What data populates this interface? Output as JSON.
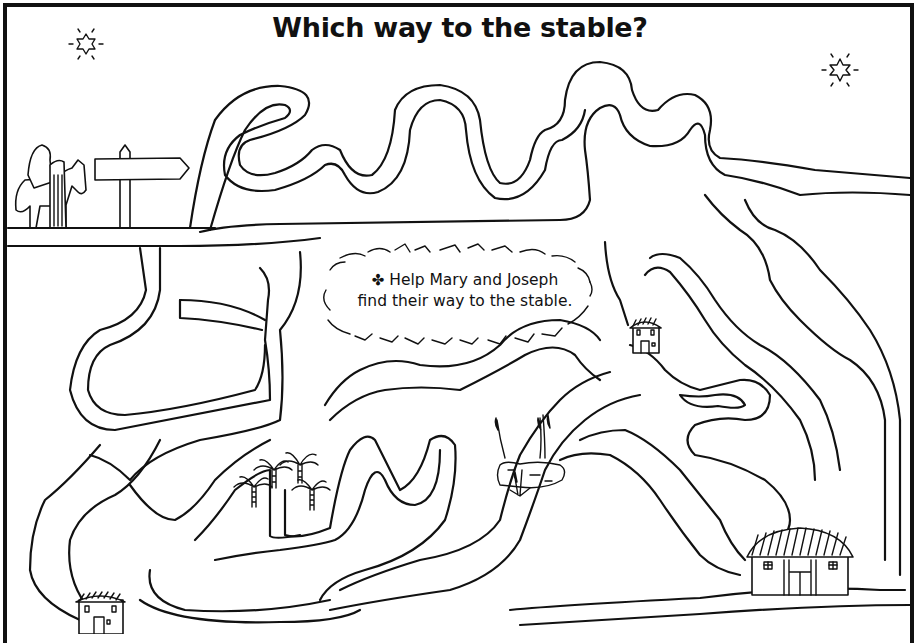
{
  "worksheet": {
    "title": "Which way to the stable?",
    "instruction_bullet": "✤",
    "instruction_line1": "Help Mary and Joseph",
    "instruction_line2": "find their way to the stable.",
    "start": {
      "label": "Mary and Joseph with donkey",
      "signpost": "signpost-arrow"
    },
    "destinations": [
      {
        "name": "small-house-bottom-left"
      },
      {
        "name": "small-house-center-right"
      },
      {
        "name": "stable-bottom-right"
      }
    ],
    "decorations": [
      "star-top-left",
      "star-top-right",
      "palm-trees",
      "pond-with-reeds",
      "grass-patch"
    ],
    "colors": {
      "ink": "#111111",
      "paper": "#ffffff"
    }
  }
}
